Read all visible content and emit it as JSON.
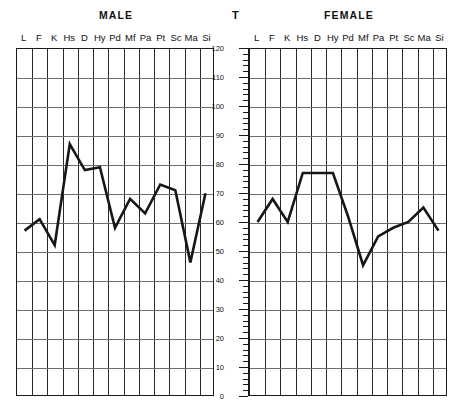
{
  "axis": {
    "label": "T",
    "ticks": [
      0,
      10,
      20,
      30,
      40,
      50,
      60,
      70,
      80,
      90,
      100,
      110,
      120
    ],
    "minor_step": 2,
    "range": [
      0,
      120
    ]
  },
  "scales": [
    "L",
    "F",
    "K",
    "Hs",
    "D",
    "Hy",
    "Pd",
    "Mf",
    "Pa",
    "Pt",
    "Sc",
    "Ma",
    "Si"
  ],
  "panels": [
    {
      "key": "male",
      "title": "MALE"
    },
    {
      "key": "female",
      "title": "FEMALE"
    }
  ],
  "chart_data": [
    {
      "type": "line",
      "title": "MALE",
      "xlabel": "",
      "ylabel": "T",
      "ylim": [
        0,
        120
      ],
      "grid": true,
      "legend": "none",
      "categories": [
        "L",
        "F",
        "K",
        "Hs",
        "D",
        "Hy",
        "Pd",
        "Mf",
        "Pa",
        "Pt",
        "Sc",
        "Ma",
        "Si"
      ],
      "series": [
        {
          "name": "MALE",
          "values": [
            57,
            61,
            52,
            87,
            78,
            79,
            58,
            68,
            63,
            73,
            71,
            46,
            70
          ]
        }
      ]
    },
    {
      "type": "line",
      "title": "FEMALE",
      "xlabel": "",
      "ylabel": "T",
      "ylim": [
        0,
        120
      ],
      "grid": true,
      "legend": "none",
      "categories": [
        "L",
        "F",
        "K",
        "Hs",
        "D",
        "Hy",
        "Pd",
        "Mf",
        "Pa",
        "Pt",
        "Sc",
        "Ma",
        "Si"
      ],
      "series": [
        {
          "name": "FEMALE",
          "values": [
            60,
            68,
            60,
            77,
            77,
            77,
            62,
            45,
            55,
            58,
            60,
            65,
            57
          ]
        }
      ]
    }
  ]
}
